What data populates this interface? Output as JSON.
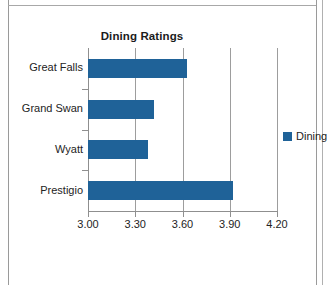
{
  "chart_data": {
    "type": "bar",
    "orientation": "horizontal",
    "title": "Dining Ratings",
    "xlabel": "",
    "ylabel": "",
    "categories": [
      "Great Falls",
      "Grand Swan",
      "Wyatt",
      "Prestigio"
    ],
    "values": [
      3.63,
      3.42,
      3.38,
      3.92
    ],
    "series": [
      {
        "name": "Dining",
        "color": "#1F6298",
        "values": [
          3.63,
          3.42,
          3.38,
          3.92
        ]
      }
    ],
    "xlim": [
      3.0,
      4.2
    ],
    "xticks": [
      3.0,
      3.3,
      3.6,
      3.9,
      4.2
    ],
    "xtick_labels": [
      "3.00",
      "3.30",
      "3.60",
      "3.90",
      "4.20"
    ],
    "grid": "vertical",
    "legend": {
      "position": "right",
      "entries": [
        {
          "label": "Dining",
          "color": "#1F6298"
        }
      ]
    }
  },
  "colors": {
    "bar": "#1F6298",
    "axis": "#8F8F8F",
    "grid": "#9D9D9D",
    "text": "#232323",
    "title": "#1B1B1B",
    "background": "#FFFFFF"
  }
}
